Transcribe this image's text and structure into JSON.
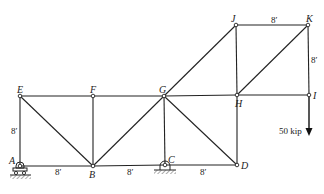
{
  "diagram": {
    "type": "truss",
    "nodes": [
      {
        "id": "A",
        "x": 20,
        "y": 166,
        "label": "A"
      },
      {
        "id": "B",
        "x": 93,
        "y": 166,
        "label": "B"
      },
      {
        "id": "C",
        "x": 165,
        "y": 165,
        "label": "C"
      },
      {
        "id": "D",
        "x": 237,
        "y": 165,
        "label": "D"
      },
      {
        "id": "E",
        "x": 20,
        "y": 96,
        "label": "E"
      },
      {
        "id": "F",
        "x": 93,
        "y": 96,
        "label": "F"
      },
      {
        "id": "G",
        "x": 164,
        "y": 96,
        "label": "G"
      },
      {
        "id": "H",
        "x": 237,
        "y": 95,
        "label": "H"
      },
      {
        "id": "I",
        "x": 309,
        "y": 95,
        "label": "I"
      },
      {
        "id": "J",
        "x": 236,
        "y": 25,
        "label": "J"
      },
      {
        "id": "K",
        "x": 308,
        "y": 25,
        "label": "K"
      }
    ],
    "members": [
      [
        "A",
        "B"
      ],
      [
        "B",
        "C"
      ],
      [
        "C",
        "D"
      ],
      [
        "E",
        "F"
      ],
      [
        "F",
        "G"
      ],
      [
        "G",
        "H"
      ],
      [
        "H",
        "I"
      ],
      [
        "J",
        "K"
      ],
      [
        "A",
        "E"
      ],
      [
        "B",
        "F"
      ],
      [
        "C",
        "G"
      ],
      [
        "D",
        "H"
      ],
      [
        "H",
        "J"
      ],
      [
        "I",
        "K"
      ],
      [
        "E",
        "B"
      ],
      [
        "B",
        "G"
      ],
      [
        "G",
        "D"
      ],
      [
        "G",
        "J"
      ],
      [
        "H",
        "K"
      ]
    ],
    "dimensions": {
      "AB": "8′",
      "BC": "8′",
      "CD": "8′",
      "AE": "8′",
      "JK": "8′",
      "KI": "8′"
    },
    "supports": [
      {
        "node": "A",
        "type": "roller"
      },
      {
        "node": "C",
        "type": "pin"
      }
    ],
    "load": {
      "node": "I",
      "value": "50 kip",
      "direction": "down"
    }
  }
}
